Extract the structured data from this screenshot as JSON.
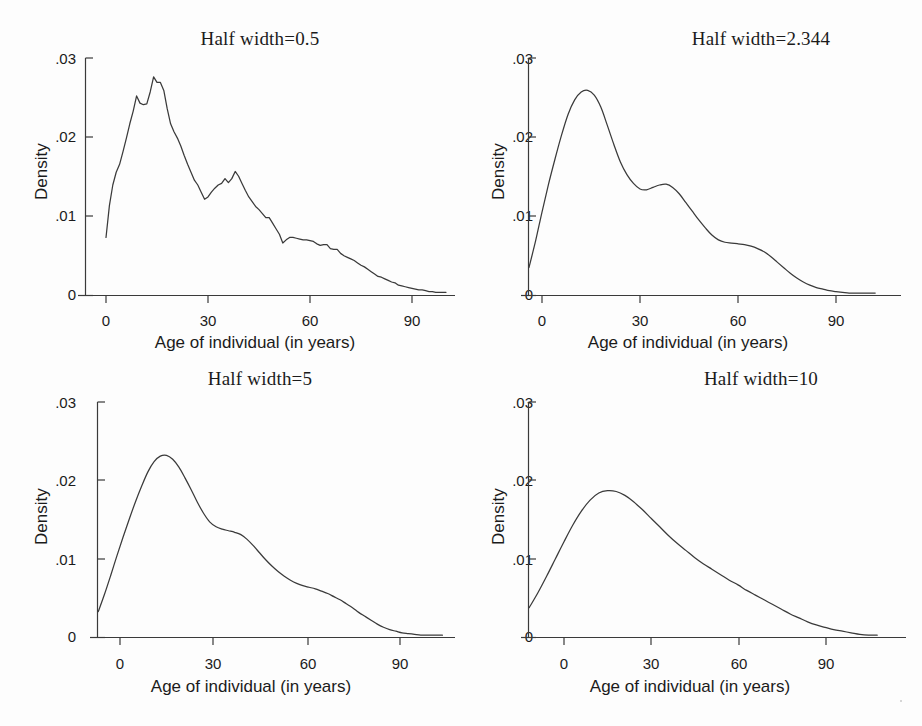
{
  "figure": {
    "name": "kernel-density-half-width-panels",
    "background": "#fdfdfd",
    "ink_color": "#3a3a3a",
    "text_color": "#1b1b1b",
    "panel_count": 4
  },
  "common": {
    "xlabel": "Age of individual (in years)",
    "ylabel": "Density",
    "xticks": [
      "0",
      "30",
      "60",
      "90"
    ],
    "xtick_values": [
      0,
      30,
      60,
      90
    ],
    "yticks": [
      "0",
      ".01",
      ".02",
      ".03"
    ],
    "ytick_values": [
      0,
      0.01,
      0.02,
      0.03
    ],
    "xlim": [
      -11,
      106
    ],
    "ylim": [
      0,
      0.031
    ],
    "grid": false,
    "legend": "none"
  },
  "chart_data": [
    {
      "type": "line",
      "panel": "top-left",
      "title": "Half width=0.5",
      "half_width": 0.5,
      "xlabel": "Age of individual (in years)",
      "ylabel": "Density",
      "xticks": [
        0,
        30,
        60,
        90
      ],
      "yticks": [
        0,
        0.01,
        0.02,
        0.03
      ],
      "xlim": [
        -1,
        101
      ],
      "ylim": [
        0,
        0.031
      ],
      "x": [
        0,
        1,
        2,
        3,
        4,
        5,
        6,
        7,
        8,
        9,
        10,
        11,
        12,
        13,
        14,
        15,
        16,
        17,
        18,
        19,
        20,
        21,
        22,
        23,
        24,
        25,
        26,
        27,
        28,
        29,
        30,
        31,
        32,
        33,
        34,
        35,
        36,
        37,
        38,
        39,
        40,
        41,
        42,
        43,
        44,
        45,
        46,
        47,
        48,
        49,
        50,
        51,
        52,
        53,
        54,
        55,
        56,
        57,
        58,
        59,
        60,
        61,
        62,
        63,
        64,
        65,
        66,
        67,
        68,
        69,
        70,
        71,
        72,
        73,
        74,
        75,
        76,
        77,
        78,
        79,
        80,
        81,
        82,
        83,
        84,
        85,
        86,
        87,
        88,
        89,
        90,
        91,
        92,
        93,
        94,
        95,
        96,
        97,
        98,
        99,
        100
      ],
      "y": [
        0.0073,
        0.0113,
        0.0139,
        0.0155,
        0.0165,
        0.0181,
        0.0198,
        0.0216,
        0.0232,
        0.0251,
        0.0242,
        0.024,
        0.0241,
        0.0256,
        0.0275,
        0.0268,
        0.0268,
        0.0258,
        0.0235,
        0.0216,
        0.0206,
        0.0198,
        0.0188,
        0.0176,
        0.0165,
        0.0155,
        0.0145,
        0.0139,
        0.013,
        0.0121,
        0.0124,
        0.013,
        0.0135,
        0.0139,
        0.0141,
        0.0147,
        0.0142,
        0.0147,
        0.0156,
        0.015,
        0.0141,
        0.0132,
        0.0124,
        0.0118,
        0.0112,
        0.0108,
        0.0103,
        0.0098,
        0.0098,
        0.0091,
        0.0084,
        0.0077,
        0.0066,
        0.007,
        0.0073,
        0.0073,
        0.0072,
        0.0071,
        0.007,
        0.007,
        0.0069,
        0.0068,
        0.0065,
        0.0063,
        0.0064,
        0.0064,
        0.0059,
        0.0058,
        0.0058,
        0.0053,
        0.005,
        0.0048,
        0.0046,
        0.0044,
        0.0041,
        0.0038,
        0.0036,
        0.0033,
        0.003,
        0.0027,
        0.0024,
        0.0023,
        0.0021,
        0.0019,
        0.0017,
        0.0016,
        0.0013,
        0.0012,
        0.0011,
        0.001,
        0.0009,
        0.0008,
        0.0007,
        0.0007,
        0.0006,
        0.0005,
        0.0005,
        0.0004,
        0.0004,
        0.0004,
        0.0004
      ],
      "smoothness": "jagged"
    },
    {
      "type": "line",
      "panel": "top-right",
      "title": "Half width=2.344",
      "half_width": 2.344,
      "xlabel": "Age of individual (in years)",
      "ylabel": "Density",
      "xticks": [
        0,
        30,
        60,
        90
      ],
      "yticks": [
        0,
        0.01,
        0.02,
        0.03
      ],
      "xlim": [
        -4,
        102
      ],
      "ylim": [
        0,
        0.031
      ],
      "x": [
        -4,
        -2,
        0,
        2,
        4,
        6,
        8,
        10,
        12,
        14,
        16,
        18,
        20,
        22,
        24,
        26,
        28,
        30,
        32,
        34,
        36,
        38,
        40,
        42,
        44,
        46,
        48,
        50,
        52,
        54,
        56,
        58,
        60,
        62,
        64,
        66,
        68,
        70,
        72,
        74,
        76,
        78,
        80,
        82,
        84,
        86,
        88,
        90,
        92,
        94,
        96,
        98,
        100,
        102
      ],
      "y": [
        0.0035,
        0.0068,
        0.0105,
        0.014,
        0.0172,
        0.0202,
        0.0228,
        0.0246,
        0.0256,
        0.0258,
        0.0252,
        0.0237,
        0.0214,
        0.019,
        0.0168,
        0.0152,
        0.0141,
        0.0134,
        0.0133,
        0.0136,
        0.0139,
        0.014,
        0.0136,
        0.0128,
        0.0117,
        0.0106,
        0.0095,
        0.0085,
        0.0076,
        0.007,
        0.0067,
        0.0066,
        0.0065,
        0.0064,
        0.0062,
        0.0059,
        0.0055,
        0.0049,
        0.0042,
        0.0035,
        0.0028,
        0.0022,
        0.0017,
        0.0013,
        0.001,
        0.0008,
        0.0006,
        0.0005,
        0.0004,
        0.0003,
        0.0003,
        0.0003,
        0.0003,
        0.0003
      ],
      "smoothness": "smooth"
    },
    {
      "type": "line",
      "panel": "bottom-left",
      "title": "Half width=5",
      "half_width": 5,
      "xlabel": "Age of individual (in years)",
      "ylabel": "Density",
      "xticks": [
        0,
        30,
        60,
        90
      ],
      "yticks": [
        0,
        0.01,
        0.02,
        0.03
      ],
      "xlim": [
        -7,
        104
      ],
      "ylim": [
        0,
        0.031
      ],
      "x": [
        -7,
        -5,
        -3,
        -1,
        1,
        3,
        5,
        7,
        9,
        11,
        13,
        15,
        17,
        19,
        21,
        23,
        25,
        27,
        29,
        31,
        33,
        35,
        37,
        39,
        41,
        43,
        45,
        47,
        49,
        51,
        53,
        55,
        57,
        59,
        61,
        63,
        65,
        67,
        69,
        71,
        73,
        75,
        77,
        79,
        81,
        83,
        85,
        87,
        89,
        91,
        93,
        95,
        97,
        99,
        101,
        104
      ],
      "y": [
        0.0033,
        0.0055,
        0.0079,
        0.0104,
        0.0128,
        0.0151,
        0.0173,
        0.0193,
        0.0211,
        0.0224,
        0.0231,
        0.0232,
        0.0227,
        0.0217,
        0.0203,
        0.0188,
        0.0172,
        0.0158,
        0.0147,
        0.0141,
        0.0138,
        0.0136,
        0.0134,
        0.0131,
        0.0125,
        0.0117,
        0.0108,
        0.0099,
        0.0091,
        0.0084,
        0.0078,
        0.0073,
        0.0069,
        0.0066,
        0.0064,
        0.0062,
        0.0059,
        0.0056,
        0.0052,
        0.0048,
        0.0043,
        0.0038,
        0.0032,
        0.0027,
        0.0022,
        0.0017,
        0.0013,
        0.001,
        0.0008,
        0.0006,
        0.0005,
        0.0004,
        0.0003,
        0.0003,
        0.0003,
        0.0003
      ],
      "smoothness": "smooth"
    },
    {
      "type": "line",
      "panel": "bottom-right",
      "title": "Half width=10",
      "half_width": 10,
      "xlabel": "Age of individual (in years)",
      "ylabel": "Density",
      "xticks": [
        0,
        30,
        60,
        90
      ],
      "yticks": [
        0,
        0.01,
        0.02,
        0.03
      ],
      "xlim": [
        -12,
        108
      ],
      "ylim": [
        0,
        0.031
      ],
      "x": [
        -12,
        -9,
        -6,
        -3,
        0,
        3,
        6,
        9,
        12,
        15,
        18,
        21,
        24,
        27,
        30,
        33,
        36,
        39,
        42,
        45,
        48,
        51,
        54,
        57,
        60,
        63,
        66,
        69,
        72,
        75,
        78,
        81,
        84,
        87,
        90,
        93,
        96,
        99,
        102,
        105,
        108
      ],
      "y": [
        0.0038,
        0.0057,
        0.0078,
        0.01,
        0.0122,
        0.0143,
        0.0161,
        0.0175,
        0.0184,
        0.0187,
        0.0186,
        0.0181,
        0.0173,
        0.0163,
        0.0152,
        0.0141,
        0.013,
        0.012,
        0.0111,
        0.0102,
        0.0094,
        0.0087,
        0.008,
        0.0073,
        0.0067,
        0.006,
        0.0054,
        0.0048,
        0.0042,
        0.0036,
        0.003,
        0.0025,
        0.002,
        0.0016,
        0.0013,
        0.001,
        0.0008,
        0.0006,
        0.0004,
        0.0003,
        0.0003
      ],
      "smoothness": "smooth"
    }
  ]
}
